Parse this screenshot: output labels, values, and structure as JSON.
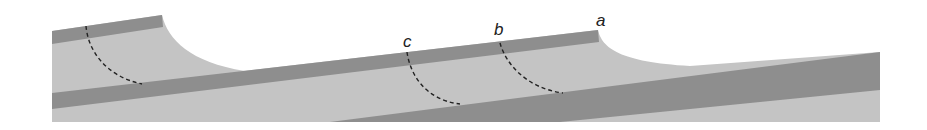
{
  "diagram": {
    "type": "geologic cross-section",
    "colors": {
      "background": "#ffffff",
      "dark_band": "#8e8e8e",
      "light_layer": "#c4c4c4",
      "dashed_line": "#222222",
      "label": "#222222"
    },
    "labels": [
      {
        "id": "a",
        "text": "a",
        "x": 596,
        "y": 26
      },
      {
        "id": "b",
        "text": "b",
        "x": 494,
        "y": 35
      },
      {
        "id": "c",
        "text": "c",
        "x": 404,
        "y": 46
      }
    ]
  }
}
